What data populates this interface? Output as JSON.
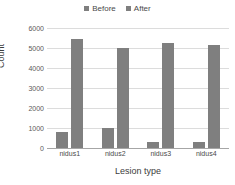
{
  "chart_data": {
    "type": "bar",
    "title": "",
    "xlabel": "Lesion type",
    "ylabel": "Count",
    "categories": [
      "nidus1",
      "nidus2",
      "nidus3",
      "nidus4"
    ],
    "series": [
      {
        "name": "Before",
        "values": [
          780,
          1000,
          300,
          290
        ],
        "color": "#7f7f7f"
      },
      {
        "name": "After",
        "values": [
          5430,
          5020,
          5270,
          5140
        ],
        "color": "#7f7f7f"
      }
    ],
    "ylim": [
      0,
      6000
    ],
    "yticks": [
      0,
      1000,
      2000,
      3000,
      4000,
      5000,
      6000
    ],
    "ytick_labels": [
      "0",
      "1000",
      "2000",
      "3000",
      "4000",
      "5000",
      "6000"
    ],
    "grid": true,
    "legend_position": "top-center",
    "legend": [
      "Before",
      "After"
    ]
  }
}
